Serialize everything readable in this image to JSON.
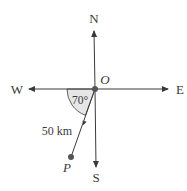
{
  "diagram": {
    "type": "compass-bearing",
    "labels": {
      "north": "N",
      "south": "S",
      "east": "E",
      "west": "W",
      "origin": "O",
      "point": "P",
      "angle": "70°",
      "distance": "50 km"
    },
    "colors": {
      "line": "#3a3a3a",
      "angle_fill": "#e6e6e6",
      "dot": "#555555"
    },
    "geometry": {
      "origin": [
        95,
        89
      ],
      "point_p": [
        71,
        157
      ],
      "angle_from_west_deg": 70
    }
  }
}
